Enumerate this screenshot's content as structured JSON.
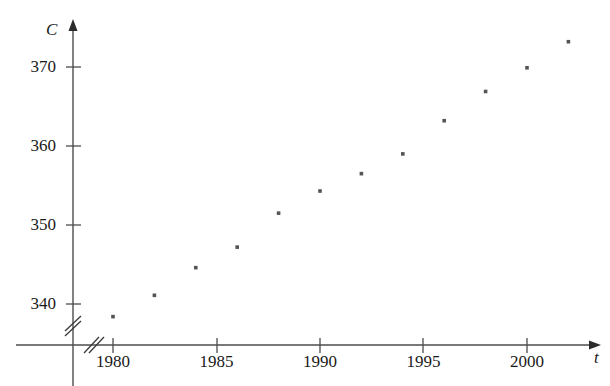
{
  "chart_data": {
    "type": "scatter",
    "title": "",
    "subtitle": "",
    "xlabel": "t",
    "ylabel": "C",
    "x": [
      1980,
      1982,
      1984,
      1986,
      1988,
      1990,
      1992,
      1994,
      1996,
      1998,
      2000,
      2002
    ],
    "values": [
      338.4,
      341.1,
      344.6,
      347.2,
      351.5,
      354.3,
      356.5,
      359.0,
      363.2,
      366.9,
      369.9,
      373.2
    ],
    "series": [
      {
        "name": "CO2 concentration",
        "values": [
          338.4,
          341.1,
          344.6,
          347.2,
          351.5,
          354.3,
          356.5,
          359.0,
          363.2,
          366.9,
          369.9,
          373.2
        ]
      }
    ],
    "xlim": [
      1978.4,
      2003.5
    ],
    "ylim": [
      335.0,
      375.5
    ],
    "xticks": [
      1980,
      1985,
      1990,
      1995,
      2000
    ],
    "xtick_labels": [
      "1980",
      "1985",
      "1990",
      "1995",
      "2000"
    ],
    "yticks": [
      340,
      350,
      360,
      370
    ],
    "ytick_labels": [
      "340",
      "350",
      "360",
      "370"
    ],
    "grid": false,
    "legend": false,
    "legend_position": "none",
    "axis_break_x": true,
    "axis_break_y": true,
    "marker": "square",
    "marker_color": "#555555",
    "axis_color": "#4d4d4d",
    "background_color": "#ffffff",
    "annotations": []
  },
  "axes": {
    "y_axis_label": "C",
    "x_axis_label": "t"
  }
}
